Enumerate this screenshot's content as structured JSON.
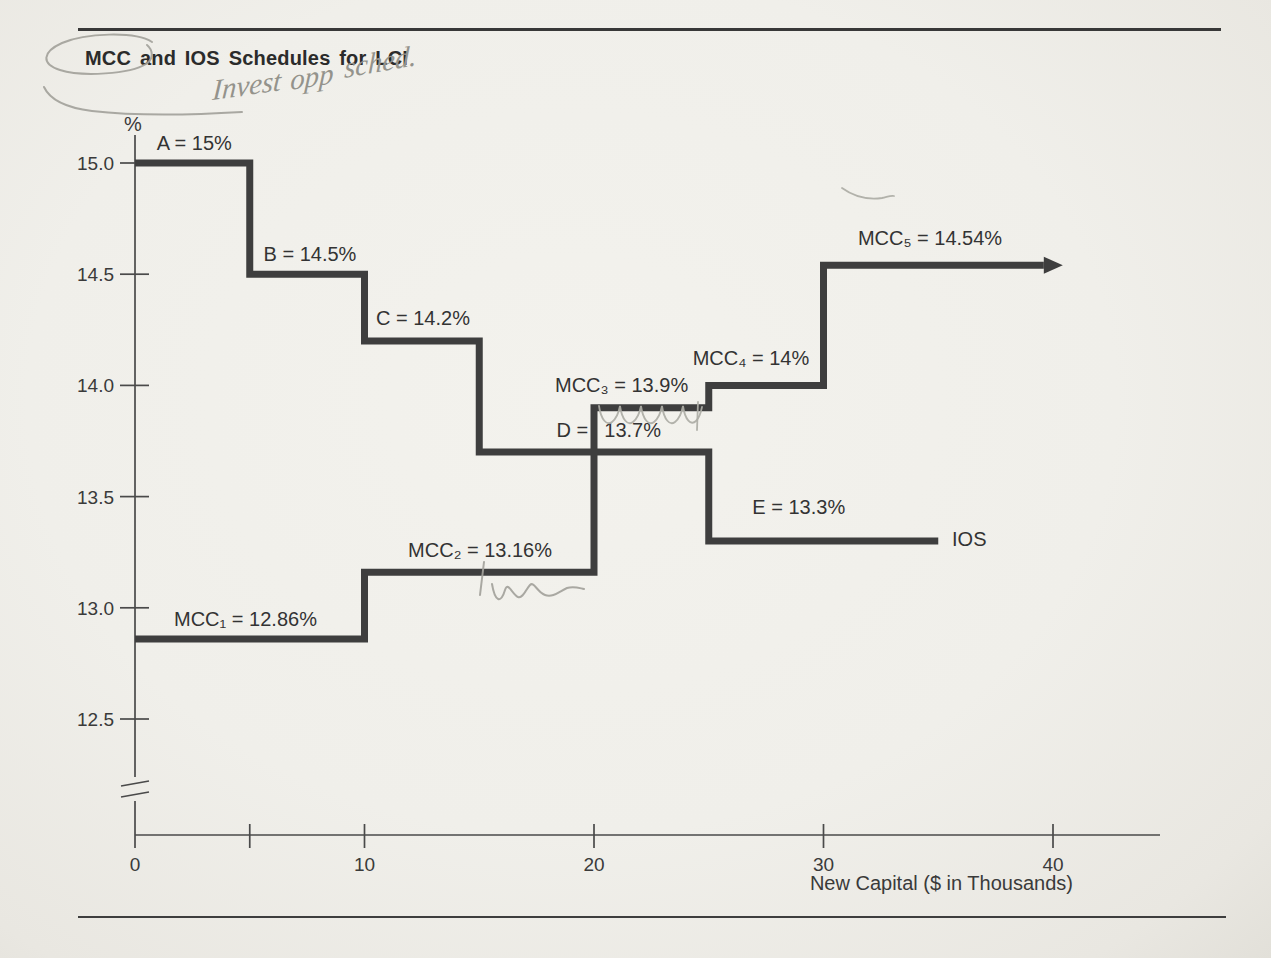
{
  "page": {
    "title": "MCC and IOS Schedules for LCI",
    "background_color": "#f0efea",
    "ink_color": "#3e3e3e",
    "pen_color": "#a3a29b"
  },
  "pen": {
    "handwriting": {
      "full_text": "Invest opp sched.",
      "words": [
        {
          "text": "Invest"
        },
        {
          "text": "opp"
        },
        {
          "text": "sched."
        }
      ]
    },
    "marks": [
      "circle-around-title",
      "tail-swoosh-near-percent",
      "curl-above-mcc5",
      "tick-and-wave-under-mcc2",
      "scallops-under-mcc3"
    ]
  },
  "chart_data": {
    "type": "line",
    "subtype": "step",
    "title": "MCC and IOS Schedules for LCI",
    "xlabel": "New Capital ($ in Thousands)",
    "ylabel": "%",
    "xlim": [
      0,
      44.6
    ],
    "ylim_shown": [
      12.5,
      15.0
    ],
    "axis_break": true,
    "grid": false,
    "line_color": "#3e3e3e",
    "x_ticks": [
      {
        "v": 0,
        "label": "0"
      },
      {
        "v": 5,
        "label": ""
      },
      {
        "v": 10,
        "label": "10"
      },
      {
        "v": 20,
        "label": "20"
      },
      {
        "v": 30,
        "label": "30"
      },
      {
        "v": 40,
        "label": "40"
      }
    ],
    "y_ticks": [
      {
        "v": 15.0,
        "label": "15.0"
      },
      {
        "v": 14.5,
        "label": "14.5"
      },
      {
        "v": 14.0,
        "label": "14.0"
      },
      {
        "v": 13.5,
        "label": "13.5"
      },
      {
        "v": 13.0,
        "label": "13.0"
      },
      {
        "v": 12.5,
        "label": "12.5"
      }
    ],
    "series": [
      {
        "name": "IOS",
        "arrow": false,
        "points": [
          [
            0,
            15.0
          ],
          [
            5,
            15.0
          ],
          [
            5,
            14.5
          ],
          [
            10,
            14.5
          ],
          [
            10,
            14.2
          ],
          [
            15,
            14.2
          ],
          [
            15,
            13.7
          ],
          [
            25,
            13.7
          ],
          [
            25,
            13.3
          ],
          [
            35,
            13.3
          ]
        ]
      },
      {
        "name": "MCC",
        "arrow": true,
        "points": [
          [
            0,
            12.86
          ],
          [
            10,
            12.86
          ],
          [
            10,
            13.16
          ],
          [
            20,
            13.16
          ],
          [
            20,
            13.9
          ],
          [
            25,
            13.9
          ],
          [
            25,
            14.0
          ],
          [
            30,
            14.0
          ],
          [
            30,
            14.54
          ],
          [
            39.6,
            14.54
          ]
        ]
      }
    ],
    "annotations": [
      {
        "text": "A = 15%",
        "x": 0.95,
        "y": 15.06,
        "anchor": "start"
      },
      {
        "text": "B = 14.5%",
        "x": 5.6,
        "y": 14.56,
        "anchor": "start"
      },
      {
        "text": "C = 14.2%",
        "x": 10.5,
        "y": 14.27,
        "anchor": "start"
      },
      {
        "text": "D =",
        "x": 19.75,
        "y": 13.77,
        "anchor": "end"
      },
      {
        "text": "13.7%",
        "x": 20.45,
        "y": 13.77,
        "anchor": "start"
      },
      {
        "text": "E = 13.3%",
        "x": 26.9,
        "y": 13.42,
        "anchor": "start"
      },
      {
        "text": "IOS",
        "x": 35.6,
        "y": 13.28,
        "anchor": "start"
      },
      {
        "text": "MCC₁ = 12.86%",
        "x": 1.7,
        "y": 12.92,
        "anchor": "start"
      },
      {
        "text": "MCC₂ = 13.16%",
        "x": 11.9,
        "y": 13.23,
        "anchor": "start"
      },
      {
        "text": "MCC₃ = 13.9%",
        "x": 18.3,
        "y": 13.97,
        "anchor": "start"
      },
      {
        "text": "MCC₄ = 14%",
        "x": 24.3,
        "y": 14.09,
        "anchor": "start"
      },
      {
        "text": "MCC₅ = 14.54%",
        "x": 31.5,
        "y": 14.63,
        "anchor": "start"
      }
    ]
  }
}
